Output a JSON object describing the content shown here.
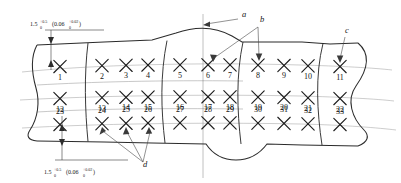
{
  "drawing": {
    "title": "Segmented strip inspection layout",
    "type": "engineering-drawing",
    "segments": 5,
    "rows": 3,
    "columns": 11,
    "marks_total": 33,
    "mark_glyph": "x-cross-mark",
    "rows_data": [
      {
        "name": "row-top",
        "labels": [
          "1",
          "2",
          "3",
          "4",
          "5",
          "6",
          "7",
          "8",
          "9",
          "10",
          "11"
        ]
      },
      {
        "name": "row-middle",
        "labels": [
          "12",
          "13",
          "14",
          "15",
          "16",
          "17",
          "18",
          "19",
          "20",
          "21",
          "22"
        ]
      },
      {
        "name": "row-bottom",
        "labels": [
          "23",
          "24",
          "25",
          "26",
          "27",
          "28",
          "29",
          "30",
          "31",
          "32",
          "33"
        ]
      }
    ],
    "mark_x": [
      60,
      102,
      126,
      148,
      180,
      208,
      230,
      258,
      284,
      308,
      340
    ],
    "row_y": [
      66,
      98,
      124
    ],
    "row_label_dy": [
      13,
      13,
      -11
    ],
    "callouts": [
      {
        "id": "a",
        "label": "a",
        "x": 244,
        "y": 17,
        "targets": [
          [
            203,
            25
          ]
        ]
      },
      {
        "id": "b",
        "label": "b",
        "x": 262,
        "y": 22,
        "targets": [
          [
            214,
            62
          ],
          [
            232,
            43
          ]
        ]
      },
      {
        "id": "c",
        "label": "c",
        "x": 347,
        "y": 33,
        "targets": [
          [
            340,
            64
          ]
        ]
      },
      {
        "id": "d",
        "label": "d",
        "x": 145,
        "y": 167,
        "targets": [
          [
            102,
            127
          ],
          [
            126,
            127
          ],
          [
            148,
            127
          ]
        ]
      }
    ],
    "dimensions": [
      {
        "id": "dim-top",
        "value": "1.5",
        "upper": "+0.5",
        "lower": "0",
        "alt_open": "(0.06",
        "alt_upper": "+0.02",
        "alt_lower": "0",
        "alt_close": ")",
        "text_x": 30,
        "text_y": 26
      },
      {
        "id": "dim-bottom",
        "value": "1.5",
        "upper": "+0.5",
        "lower": "0",
        "alt_open": "(0.06",
        "alt_upper": "+0.02",
        "alt_lower": "0",
        "alt_close": ")",
        "text_x": 44,
        "text_y": 174
      }
    ],
    "colors": {
      "outline": "#2b2b2b",
      "mark": "#1d1d1d",
      "centerline": "#8a8a8a",
      "leader": "#555555",
      "background": "#ffffff"
    }
  }
}
